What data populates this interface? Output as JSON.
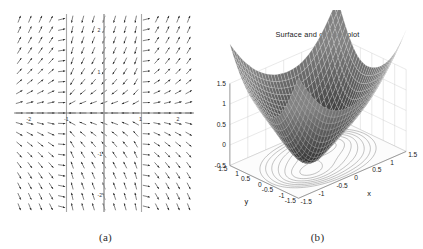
{
  "figure": {
    "panels": [
      {
        "caption": "(a)",
        "kind": "phase-portrait",
        "chart_data": {
          "type": "scatter",
          "title": "",
          "xlabel": "",
          "ylabel": "",
          "xlim": [
            -2.4,
            2.4
          ],
          "ylim": [
            -2.4,
            2.4
          ],
          "grid": false,
          "xticks": [
            -2,
            -1,
            1,
            2
          ],
          "xticklabels": [
            "-2",
            "-1",
            "1",
            "2"
          ],
          "yticks": [
            -2,
            -1,
            1,
            2
          ],
          "yticklabels": [
            "-2",
            "-1",
            "1",
            "2"
          ],
          "annotations": [
            "vector field / direction field with arrowheads",
            "equilibria on the x-axis near x = -1, x = 0, x = 1",
            "vertical separatrix lines at x = -1, x = 0, x = 1"
          ],
          "equilibria": [
            {
              "x": -1,
              "y": 0,
              "type": "saddle"
            },
            {
              "x": 0,
              "y": 0,
              "type": "saddle"
            },
            {
              "x": 1,
              "y": 0,
              "type": "saddle"
            }
          ]
        }
      },
      {
        "caption": "(b)",
        "kind": "surface-contour",
        "chart_data": {
          "type": "surface",
          "title": "Surface and contour plot",
          "xlabel": "x",
          "ylabel": "y",
          "zlabel": "",
          "xlim": [
            -1.5,
            1.5
          ],
          "ylim": [
            -1.5,
            1.5
          ],
          "zlim": [
            -0.5,
            1.5
          ],
          "grid": true,
          "xticks": [
            -1.5,
            -1,
            -0.5,
            0,
            0.5,
            1,
            1.5
          ],
          "xticklabels": [
            "-1.5",
            "-1",
            "-0.5",
            "0",
            "0.5",
            "1",
            "1.5"
          ],
          "yticks": [
            -1.5,
            -1,
            -0.5,
            0,
            0.5,
            1,
            1.5
          ],
          "yticklabels": [
            "1.5",
            "1",
            "0.5",
            "0",
            "-0.5",
            "-1",
            "-1.5"
          ],
          "zticks": [
            -0.5,
            0,
            0.5,
            1,
            1.5
          ],
          "zticklabels": [
            "-0.5",
            "0",
            "0.5",
            "1",
            "1.5"
          ],
          "contour_levels": [
            -0.4,
            -0.2,
            0,
            0.2,
            0.4,
            0.6,
            0.8,
            1.0
          ],
          "annotations": [
            "mesh surface with two local minima (double-well)",
            "contour projection drawn on the base plane",
            "two closed contour islands around the two minima"
          ]
        }
      }
    ]
  },
  "style": {
    "ink": "#1a1a1a",
    "axis": "#555555",
    "mesh": "#2a2a2a",
    "contour": "#777777",
    "grid": "#c8c8c8",
    "background": "#ffffff"
  }
}
